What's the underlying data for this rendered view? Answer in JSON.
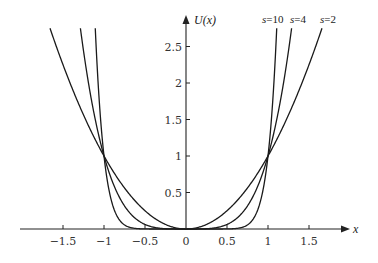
{
  "chart_data": {
    "type": "line",
    "title": "",
    "xlabel": "x",
    "ylabel": "U(x)",
    "function": "U(x) = |x|^s",
    "xlim": [
      -2.0,
      2.0
    ],
    "ylim": [
      0,
      2.8
    ],
    "grid": false,
    "legend": "inline labels at top right of curves",
    "x_ticks": [
      -1.5,
      -1,
      -0.5,
      0,
      0.5,
      1,
      1.5
    ],
    "x_tick_labels": [
      "−1.5",
      "−1",
      "−0.5",
      "0",
      "0.5",
      "1",
      "1.5"
    ],
    "y_ticks": [
      0.5,
      1,
      1.5,
      2,
      2.5
    ],
    "y_tick_labels": [
      "0.5",
      "1",
      "1.5",
      "2",
      "2.5"
    ],
    "series": [
      {
        "name": "s=2",
        "s": 2,
        "label_prefix": "s",
        "label_value": "=2"
      },
      {
        "name": "s=4",
        "s": 4,
        "label_prefix": "s",
        "label_value": "=4"
      },
      {
        "name": "s=10",
        "s": 10,
        "label_prefix": "s",
        "label_value": "=10"
      }
    ],
    "annotations": [
      "All curves intersect at (−1, 1) and (1, 1)",
      "All curves pass through (0, 0)"
    ]
  },
  "axes": {
    "x_label": "x",
    "y_label": "U(x)"
  }
}
